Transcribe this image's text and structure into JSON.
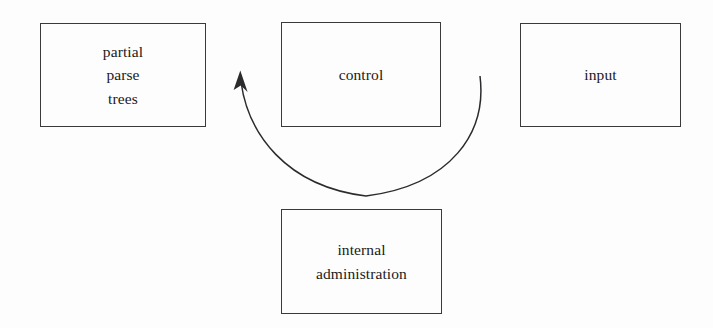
{
  "diagram": {
    "background_color": "#fdfdfd",
    "stroke_color": "#2b2b2d",
    "nodes": [
      {
        "id": "partial-parse-trees",
        "lines": [
          "partial",
          "parse",
          "trees"
        ]
      },
      {
        "id": "control",
        "lines": [
          "control"
        ]
      },
      {
        "id": "input",
        "lines": [
          "input"
        ]
      },
      {
        "id": "internal-administration",
        "lines": [
          "internal",
          "administration"
        ]
      }
    ],
    "connectors": [
      {
        "id": "feedback-arrow",
        "name": "curved-feedback-arrow",
        "from": "control-right-side",
        "to": "control-left-side",
        "direction": "counter-clockwise",
        "arrowhead": "end",
        "style": "curved-open-arc-below-control"
      }
    ]
  }
}
